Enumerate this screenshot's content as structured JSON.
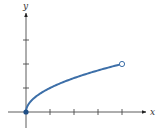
{
  "chart_data": {
    "type": "line",
    "title": "",
    "xlabel": "x",
    "ylabel": "y",
    "function": "y = sqrt(x)",
    "domain": [
      0,
      4
    ],
    "x": [
      0,
      0.25,
      0.5,
      1,
      1.5,
      2,
      2.5,
      3,
      3.5,
      4
    ],
    "series": [
      {
        "name": "y = √x",
        "values": [
          0,
          0.5,
          0.7071,
          1,
          1.2247,
          1.4142,
          1.5811,
          1.7321,
          1.8708,
          2
        ],
        "color": "#3d6fa8"
      }
    ],
    "endpoints": [
      {
        "x": 0,
        "y": 0,
        "style": "closed"
      },
      {
        "x": 4,
        "y": 2,
        "style": "open"
      }
    ],
    "x_ticks": [
      1,
      2,
      3,
      4
    ],
    "y_ticks": [
      1,
      2,
      3
    ],
    "tick_labels_shown": false,
    "xlim": [
      -0.75,
      5
    ],
    "ylim": [
      -0.7,
      4
    ],
    "grid": false,
    "legend": "none"
  },
  "axes": {
    "x_label": "x",
    "y_label": "y"
  },
  "colors": {
    "curve": "#3d6fa8",
    "axis": "#4a4a4a",
    "background": "#ffffff"
  }
}
